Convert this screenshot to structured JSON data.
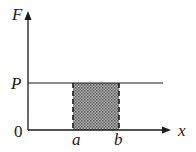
{
  "diagram": {
    "type": "force-displacement graph",
    "axes": {
      "y_label": "F",
      "x_label": "x",
      "origin_label": "0"
    },
    "levels": {
      "force_label": "P"
    },
    "interval": {
      "start_label": "a",
      "end_label": "b"
    },
    "shaded_region": "work done = area under F between a and b",
    "colors": {
      "lines": "#1a1a1a",
      "shade": "#8a8a8a",
      "background": "#ffffff"
    }
  }
}
